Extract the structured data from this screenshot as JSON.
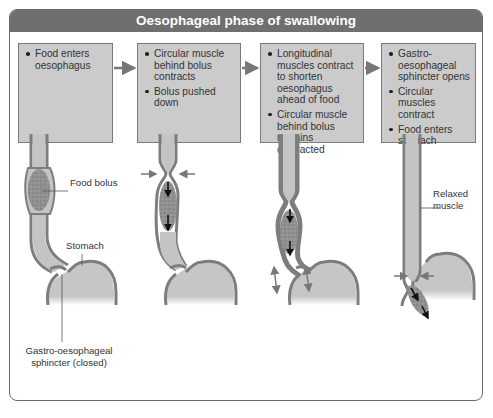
{
  "title": "Oesophageal phase of swallowing",
  "steps": [
    {
      "bullets": [
        "Food enters oesophagus"
      ]
    },
    {
      "bullets": [
        "Circular muscle behind bolus contracts",
        "Bolus pushed down"
      ]
    },
    {
      "bullets": [
        "Longitudinal muscles contract to shorten oesophagus ahead of food",
        "Circular muscle behind bolus remains contracted"
      ]
    },
    {
      "bullets": [
        "Gastro-oesophageal sphincter opens",
        "Circular muscles contract",
        "Food enters stomach"
      ]
    }
  ],
  "labels": {
    "food_bolus": "Food bolus",
    "stomach": "Stomach",
    "sphincter_closed": "Gastro-oesophageal sphincter (closed)",
    "relaxed_muscle": "Relaxed muscle"
  },
  "colors": {
    "title_bar": "#6f6f6f",
    "box_fill": "#cbcbcb",
    "muscle_wall": "#7d7d7d",
    "lumen": "#c4c4c4",
    "bolus": "#8f8f8f",
    "arrow_grey": "#777777",
    "arrow_black": "#111111"
  }
}
